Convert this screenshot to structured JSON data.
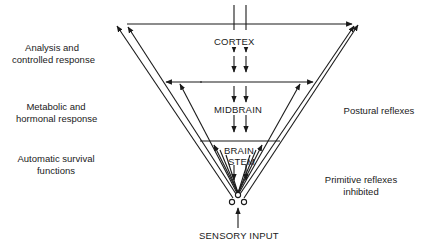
{
  "left_labels": {
    "cortex": [
      "Analysis and",
      "controlled response"
    ],
    "midbrain": [
      "Metabolic and",
      "hormonal response"
    ],
    "brainstem": [
      "Automatic survival",
      "functions"
    ]
  },
  "right_labels": {
    "midbrain": "Postural reflexes",
    "brainstem": [
      "Primitive reflexes",
      "inhibited"
    ]
  },
  "levels": {
    "cortex": "CORTEX",
    "midbrain": "MIDBRAIN",
    "brainstem": [
      "BRAIN",
      "STEM"
    ]
  },
  "input_label": "SENSORY INPUT",
  "colors": {
    "line": "#1a1a1a",
    "background": "#ffffff"
  }
}
